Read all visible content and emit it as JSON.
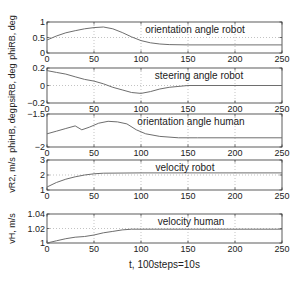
{
  "chart_data": [
    {
      "type": "line",
      "title": "orientation angle robot",
      "ylabel": "phi_RB, deg",
      "ylim": [
        0,
        1
      ],
      "yticks": [
        "0",
        "0.5",
        "1"
      ],
      "xlim": [
        0,
        250
      ],
      "xticks": [
        "0",
        "50",
        "100",
        "150",
        "200",
        "250"
      ],
      "grid": true,
      "x": [
        0,
        10,
        20,
        30,
        40,
        50,
        60,
        70,
        80,
        90,
        100,
        110,
        120,
        130,
        150,
        200,
        250
      ],
      "values": [
        0.42,
        0.55,
        0.65,
        0.72,
        0.78,
        0.82,
        0.84,
        0.78,
        0.66,
        0.52,
        0.4,
        0.33,
        0.29,
        0.27,
        0.26,
        0.26,
        0.26
      ]
    },
    {
      "type": "line",
      "title": "steering angle robot",
      "ylabel": "psi_RB, deg",
      "ylim": [
        -0.2,
        0.2
      ],
      "yticks": [
        "-0.2",
        "0",
        "0.2"
      ],
      "xlim": [
        0,
        250
      ],
      "xticks": [
        "0",
        "50",
        "100",
        "150",
        "200",
        "250"
      ],
      "grid": true,
      "x": [
        0,
        10,
        20,
        30,
        40,
        50,
        60,
        70,
        80,
        90,
        100,
        110,
        120,
        130,
        150,
        200,
        250
      ],
      "values": [
        0.17,
        0.15,
        0.13,
        0.1,
        0.07,
        0.05,
        0.02,
        -0.02,
        -0.05,
        -0.08,
        -0.09,
        -0.07,
        -0.04,
        -0.02,
        0.0,
        0.0,
        0.0
      ]
    },
    {
      "type": "line",
      "title": "orientation angle human",
      "ylabel": "phi_HB, deg",
      "ylim": [
        -2,
        -1.5
      ],
      "yticks": [
        "-2",
        "-1.5"
      ],
      "xlim": [
        0,
        250
      ],
      "xticks": [
        "0",
        "50",
        "100",
        "150",
        "200",
        "250"
      ],
      "grid": true,
      "x": [
        0,
        10,
        20,
        30,
        37,
        45,
        55,
        65,
        75,
        85,
        95,
        105,
        120,
        140,
        160,
        200,
        250
      ],
      "values": [
        -1.8,
        -1.76,
        -1.72,
        -1.68,
        -1.74,
        -1.7,
        -1.64,
        -1.61,
        -1.62,
        -1.65,
        -1.74,
        -1.8,
        -1.84,
        -1.86,
        -1.86,
        -1.86,
        -1.86
      ]
    },
    {
      "type": "line",
      "title": "velocity robot",
      "ylabel": "vR2, m/s",
      "ylim": [
        1,
        3
      ],
      "yticks": [
        "1",
        "2",
        "3"
      ],
      "xlim": [
        0,
        250
      ],
      "xticks": [
        "0",
        "50",
        "100",
        "150",
        "200",
        "250"
      ],
      "grid": true,
      "x": [
        0,
        10,
        20,
        30,
        40,
        50,
        60,
        100,
        150,
        200,
        250
      ],
      "values": [
        1.2,
        1.5,
        1.72,
        1.88,
        2.0,
        2.08,
        2.12,
        2.14,
        2.14,
        2.14,
        2.14
      ]
    },
    {
      "type": "line",
      "title": "velocity human",
      "ylabel": "vH, m/s",
      "ylim": [
        1,
        1.04
      ],
      "yticks": [
        "1",
        "1.02",
        "1.04"
      ],
      "xlim": [
        0,
        250
      ],
      "xticks": [
        "0",
        "50",
        "100",
        "150",
        "200",
        "250"
      ],
      "xlabel": "t, 100steps=10s",
      "grid": true,
      "x": [
        0,
        10,
        20,
        30,
        40,
        50,
        60,
        70,
        80,
        90,
        100,
        150,
        200,
        250
      ],
      "values": [
        1.0,
        1.003,
        1.006,
        1.008,
        1.009,
        1.011,
        1.014,
        1.016,
        1.018,
        1.019,
        1.019,
        1.019,
        1.019,
        1.019
      ]
    }
  ],
  "figure": {
    "xlabel": "t, 100steps=10s",
    "line_color": "#6e6e6e",
    "grid_color": "#9a9a9a"
  }
}
